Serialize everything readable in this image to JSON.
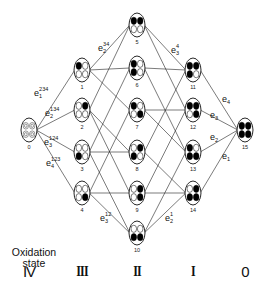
{
  "diagram": {
    "oxidation_title_line1": "Oxidation",
    "oxidation_title_line2": "state",
    "oxidation_states": [
      {
        "label": "IV",
        "x": 29
      },
      {
        "label": "III",
        "x": 82
      },
      {
        "label": "II",
        "x": 137
      },
      {
        "label": "I",
        "x": 193
      },
      {
        "label": "0",
        "x": 245
      }
    ],
    "nodes": [
      {
        "id": "0",
        "x": 29,
        "y": 130,
        "dots": "ring"
      },
      {
        "id": "1",
        "x": 82,
        "y": 70,
        "dots": [
          1,
          0,
          0,
          0
        ]
      },
      {
        "id": "2",
        "x": 82,
        "y": 110,
        "dots": [
          0,
          1,
          0,
          0
        ]
      },
      {
        "id": "3",
        "x": 82,
        "y": 152,
        "dots": [
          0,
          0,
          1,
          0
        ]
      },
      {
        "id": "4",
        "x": 82,
        "y": 193,
        "dots": [
          0,
          0,
          0,
          1
        ]
      },
      {
        "id": "5",
        "x": 137,
        "y": 25,
        "dots": [
          1,
          1,
          0,
          0
        ]
      },
      {
        "id": "6",
        "x": 137,
        "y": 68,
        "dots": [
          1,
          0,
          1,
          0
        ]
      },
      {
        "id": "7",
        "x": 137,
        "y": 110,
        "dots": [
          1,
          0,
          0,
          1
        ]
      },
      {
        "id": "8",
        "x": 137,
        "y": 152,
        "dots": [
          0,
          1,
          1,
          0
        ]
      },
      {
        "id": "9",
        "x": 137,
        "y": 193,
        "dots": [
          0,
          1,
          0,
          1
        ]
      },
      {
        "id": "10",
        "x": 137,
        "y": 233,
        "dots": [
          0,
          0,
          1,
          1
        ]
      },
      {
        "id": "11",
        "x": 193,
        "y": 70,
        "dots": [
          1,
          1,
          1,
          0
        ]
      },
      {
        "id": "12",
        "x": 193,
        "y": 110,
        "dots": [
          1,
          1,
          0,
          1
        ]
      },
      {
        "id": "13",
        "x": 193,
        "y": 152,
        "dots": [
          1,
          0,
          1,
          1
        ]
      },
      {
        "id": "14",
        "x": 193,
        "y": 193,
        "dots": [
          0,
          1,
          1,
          1
        ]
      },
      {
        "id": "15",
        "x": 245,
        "y": 130,
        "dots": [
          1,
          1,
          1,
          1
        ]
      }
    ],
    "edge_labels": [
      {
        "base": "e",
        "sub": "1",
        "sup": "234",
        "x": 34,
        "y": 96
      },
      {
        "base": "e",
        "sub": "2",
        "sup": "134",
        "x": 45,
        "y": 116
      },
      {
        "base": "e",
        "sub": "3",
        "sup": "124",
        "x": 44,
        "y": 145
      },
      {
        "base": "e",
        "sub": "4",
        "sup": "123",
        "x": 46,
        "y": 166
      },
      {
        "base": "e",
        "sub": "2",
        "sup": "34",
        "x": 98,
        "y": 51
      },
      {
        "base": "e",
        "sub": "3",
        "sup": "4",
        "x": 171,
        "y": 53
      },
      {
        "base": "e",
        "sub": "4",
        "sup": "",
        "x": 222,
        "y": 102
      },
      {
        "base": "e",
        "sub": "3",
        "sup": "",
        "x": 210,
        "y": 118
      },
      {
        "base": "e",
        "sub": "2",
        "sup": "",
        "x": 210,
        "y": 140
      },
      {
        "base": "e",
        "sub": "1",
        "sup": "",
        "x": 222,
        "y": 159
      },
      {
        "base": "e",
        "sub": "3",
        "sup": "12",
        "x": 100,
        "y": 221
      },
      {
        "base": "e",
        "sub": "2",
        "sup": "1",
        "x": 165,
        "y": 221
      }
    ]
  }
}
